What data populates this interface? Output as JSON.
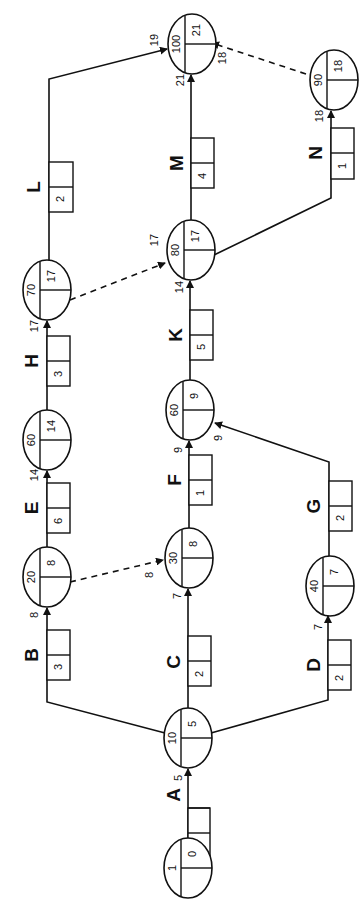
{
  "diagram": {
    "type": "activity-network",
    "orientation": "rotated -90deg",
    "nodes": [
      {
        "id": "n1",
        "event": "1",
        "time": "0"
      },
      {
        "id": "n10",
        "event": "10",
        "time": "5"
      },
      {
        "id": "n20",
        "event": "20",
        "time": "8"
      },
      {
        "id": "n30",
        "event": "30",
        "time": "8"
      },
      {
        "id": "n40",
        "event": "40",
        "time": "7"
      },
      {
        "id": "n60a",
        "event": "60",
        "time": "14"
      },
      {
        "id": "n60b",
        "event": "60",
        "time": "9"
      },
      {
        "id": "n70",
        "event": "70",
        "time": "17"
      },
      {
        "id": "n80",
        "event": "80",
        "time": "17"
      },
      {
        "id": "n90",
        "event": "90",
        "time": "18"
      },
      {
        "id": "n100",
        "event": "100",
        "time": "21"
      }
    ],
    "activities": [
      {
        "label": "A",
        "duration": "5",
        "from": "n1",
        "to": "n10",
        "arrival": "5"
      },
      {
        "label": "B",
        "duration": "3",
        "from": "n10",
        "to": "n20",
        "arrival": "8"
      },
      {
        "label": "C",
        "duration": "2",
        "from": "n10",
        "to": "n30",
        "arrival": "7"
      },
      {
        "label": "D",
        "duration": "2",
        "from": "n10",
        "to": "n40",
        "arrival": "7"
      },
      {
        "label": "E",
        "duration": "6",
        "from": "n20",
        "to": "n60a",
        "arrival": "14"
      },
      {
        "label": "F",
        "duration": "1",
        "from": "n30",
        "to": "n60b",
        "arrival": "9"
      },
      {
        "label": "G",
        "duration": "2",
        "from": "n40",
        "to": "n60b",
        "arrival": "9"
      },
      {
        "label": "H",
        "duration": "3",
        "from": "n60a",
        "to": "n70",
        "arrival": "17"
      },
      {
        "label": "K",
        "duration": "5",
        "from": "n60b",
        "to": "n80",
        "arrival": "14"
      },
      {
        "label": "L",
        "duration": "2",
        "from": "n70",
        "to": "n100",
        "arrival": "19"
      },
      {
        "label": "M",
        "duration": "4",
        "from": "n80",
        "to": "n100",
        "arrival": "21"
      },
      {
        "label": "N",
        "duration": "1",
        "from": "n80",
        "to": "n90",
        "arrival": "18"
      }
    ],
    "dummies": [
      {
        "from": "n20",
        "to": "n30",
        "arrival": "8"
      },
      {
        "from": "n70",
        "to": "n80",
        "arrival": "17"
      },
      {
        "from": "n90",
        "to": "n100",
        "arrival": "18"
      }
    ]
  }
}
